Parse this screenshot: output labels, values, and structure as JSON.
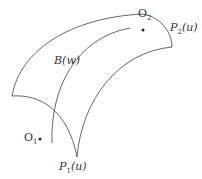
{
  "diagram": {
    "labels": {
      "o1": {
        "base": "O",
        "sub": "1"
      },
      "o2": {
        "base": "O",
        "sub": "2"
      },
      "p1": {
        "base": "P",
        "sub": "1",
        "arg": "(u)"
      },
      "p2": {
        "base": "P",
        "sub": "2",
        "arg": "(u)"
      },
      "b": {
        "text": "B(w)"
      }
    },
    "colors": {
      "stroke": "#555555",
      "text": "#333333",
      "background": "#ffffff"
    }
  }
}
